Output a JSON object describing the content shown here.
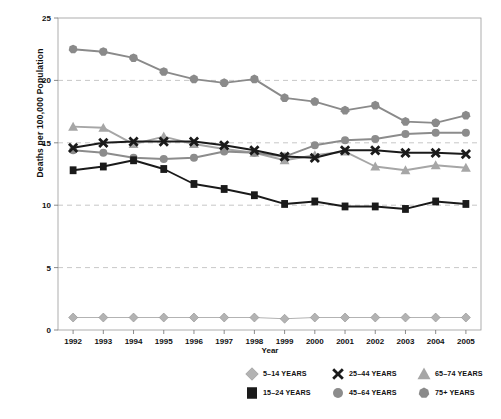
{
  "chart_data": {
    "type": "line",
    "title": "",
    "xlabel": "Year",
    "ylabel": "Deaths per 100,000 Population",
    "categories": [
      1992,
      1993,
      1994,
      1995,
      1996,
      1997,
      1998,
      1999,
      2000,
      2001,
      2002,
      2003,
      2004,
      2005
    ],
    "x": [
      "1992",
      "1993",
      "1994",
      "1995",
      "1996",
      "1997",
      "1998",
      "1999",
      "2000",
      "2001",
      "2002",
      "2003",
      "2004",
      "2005"
    ],
    "ylim": [
      0,
      25
    ],
    "xlim": [
      "1992",
      "2005"
    ],
    "yticks": [
      "0",
      "5",
      "10",
      "15",
      "20",
      "25"
    ],
    "grid": "horizontal-dashed",
    "legend_position": "bottom",
    "series": [
      {
        "name": "5–14 YEARS",
        "marker": "diamond",
        "color": "#b3b3b3",
        "line_color": "#b3b3b3",
        "values": [
          1.0,
          1.0,
          1.0,
          1.0,
          1.0,
          1.0,
          1.0,
          0.9,
          1.0,
          1.0,
          1.0,
          1.0,
          1.0,
          1.0
        ]
      },
      {
        "name": "15–24 YEARS",
        "marker": "square",
        "color": "#1a1a1a",
        "line_color": "#1a1a1a",
        "values": [
          12.8,
          13.1,
          13.6,
          12.9,
          11.7,
          11.3,
          10.8,
          10.1,
          10.3,
          9.9,
          9.9,
          9.7,
          10.3,
          10.1
        ]
      },
      {
        "name": "25–44 YEARS",
        "marker": "x",
        "color": "#1a1a1a",
        "line_color": "#1a1a1a",
        "values": [
          14.6,
          15.0,
          15.1,
          15.1,
          15.1,
          14.8,
          14.4,
          13.9,
          13.8,
          14.4,
          14.4,
          14.2,
          14.2,
          14.1
        ]
      },
      {
        "name": "45–64 YEARS",
        "marker": "circle",
        "color": "#8c8c8c",
        "line_color": "#8c8c8c",
        "values": [
          14.4,
          14.2,
          13.8,
          13.7,
          13.8,
          14.3,
          14.2,
          13.9,
          14.8,
          15.2,
          15.3,
          15.7,
          15.8,
          15.8
        ]
      },
      {
        "name": "65–74 YEARS",
        "marker": "triangle",
        "color": "#a6a6a6",
        "line_color": "#a6a6a6",
        "values": [
          16.3,
          16.2,
          14.9,
          15.5,
          14.9,
          14.5,
          14.2,
          13.6,
          14.0,
          14.3,
          13.1,
          12.8,
          13.2,
          13.0
        ]
      },
      {
        "name": "75+ YEARS",
        "marker": "heptagon",
        "color": "#8a8a8a",
        "line_color": "#8a8a8a",
        "values": [
          22.5,
          22.3,
          21.8,
          20.7,
          20.1,
          19.8,
          20.1,
          18.6,
          18.3,
          17.6,
          18.0,
          16.7,
          16.6,
          17.2
        ]
      }
    ]
  },
  "axes": {
    "ylabel": "Deaths per 100,000 Population",
    "xlabel": "Year",
    "ytick_labels": [
      "25",
      "20",
      "15",
      "10",
      "5",
      "0"
    ],
    "xtick_labels": [
      "1992",
      "1993",
      "1994",
      "1995",
      "1996",
      "1997",
      "1998",
      "1999",
      "2000",
      "2001",
      "2002",
      "2003",
      "2004",
      "2005"
    ]
  },
  "legend": {
    "items": [
      {
        "label": "5–14 YEARS",
        "marker": "diamond-marker",
        "color": "#b3b3b3"
      },
      {
        "label": "25–44 YEARS",
        "marker": "x-marker",
        "color": "#1a1a1a"
      },
      {
        "label": "65–74 YEARS",
        "marker": "triangle-marker",
        "color": "#a6a6a6"
      },
      {
        "label": "15–24 YEARS",
        "marker": "square-marker",
        "color": "#1a1a1a"
      },
      {
        "label": "45–64 YEARS",
        "marker": "circle-marker",
        "color": "#8c8c8c"
      },
      {
        "label": "75+ YEARS",
        "marker": "heptagon-marker",
        "color": "#8a8a8a"
      }
    ]
  }
}
